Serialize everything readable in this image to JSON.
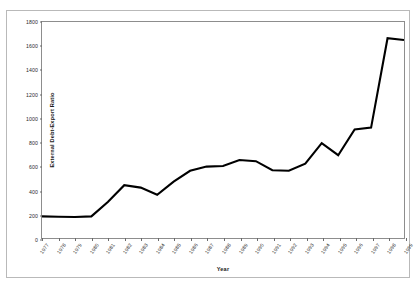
{
  "chart_data": {
    "type": "line",
    "title": "",
    "xlabel": "Year",
    "ylabel": "External Debt-Export Ratio",
    "ylim": [
      0,
      1800
    ],
    "ytick_step": 200,
    "yticks": [
      0,
      200,
      400,
      600,
      800,
      1000,
      1200,
      1400,
      1600,
      1800
    ],
    "grid": false,
    "legend": null,
    "line_color": "#000000",
    "categories": [
      "1977",
      "1978",
      "1979",
      "1980",
      "1981",
      "1982",
      "1983",
      "1984",
      "1985",
      "1986",
      "1987",
      "1988",
      "1989",
      "1990",
      "1991",
      "1992",
      "1993",
      "1994",
      "1995",
      "1996",
      "1997",
      "1998",
      "1999"
    ],
    "values": [
      180,
      177,
      175,
      180,
      300,
      440,
      420,
      360,
      470,
      560,
      595,
      600,
      650,
      640,
      565,
      560,
      620,
      790,
      690,
      905,
      920,
      1665,
      1650
    ],
    "series": [
      {
        "name": "External Debt-Export Ratio",
        "values": [
          180,
          177,
          175,
          180,
          300,
          440,
          420,
          360,
          470,
          560,
          595,
          600,
          650,
          640,
          565,
          560,
          620,
          790,
          690,
          905,
          920,
          1665,
          1650
        ]
      }
    ]
  },
  "figure": {
    "top_caption": ""
  }
}
